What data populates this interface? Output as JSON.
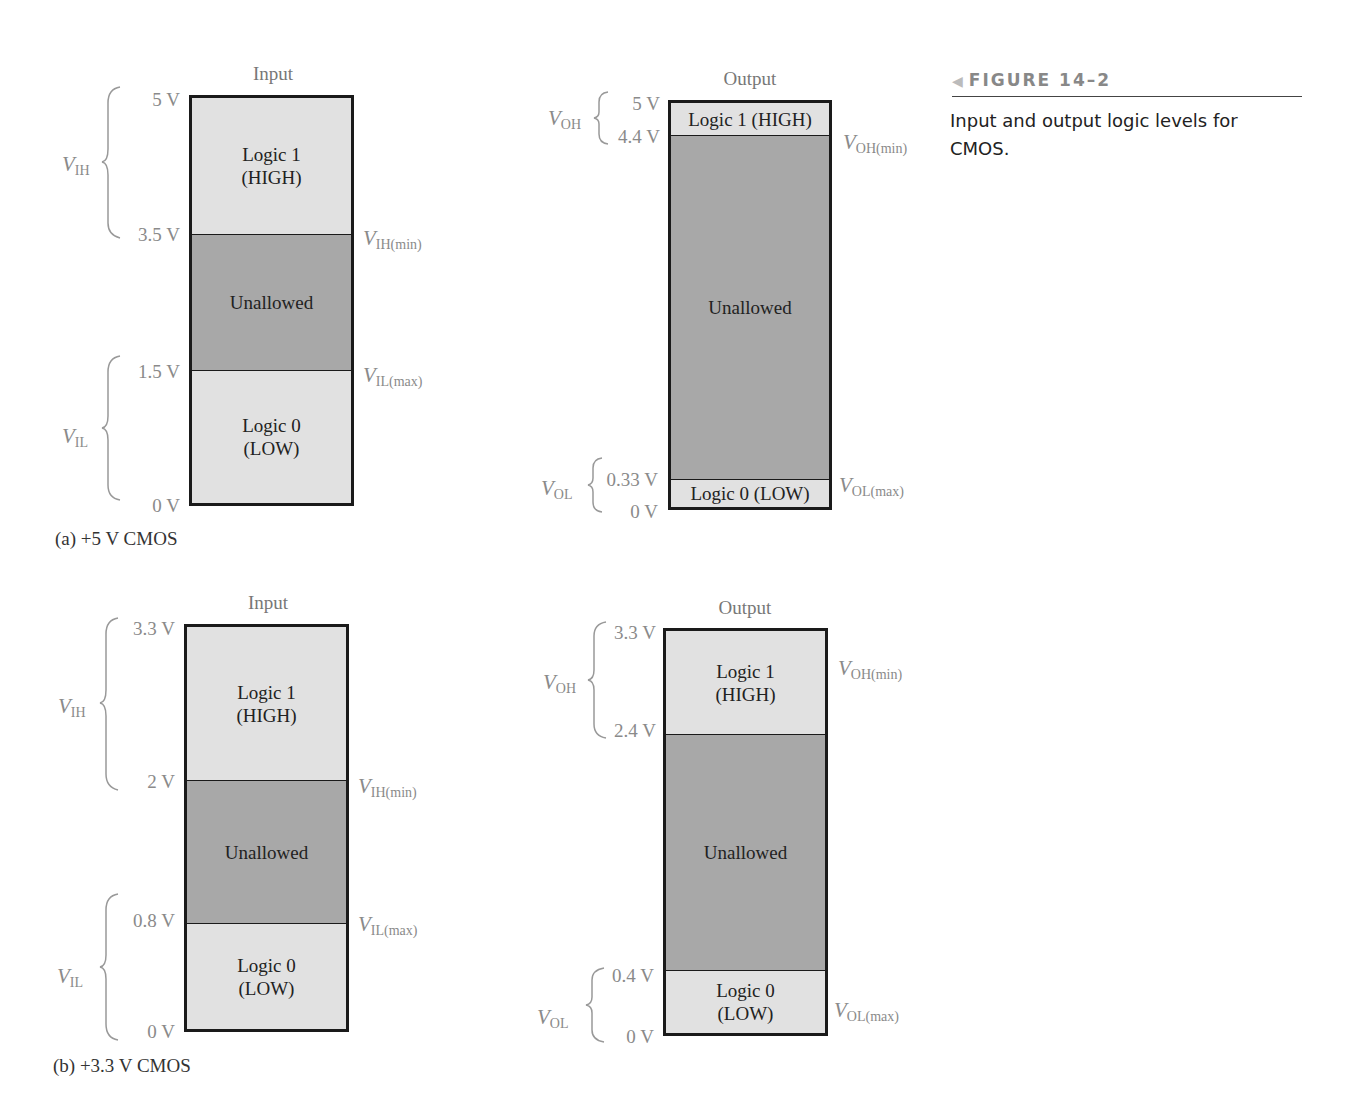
{
  "figure": {
    "number_label": "FIGURE 14–2",
    "arrow_icon": "left-triangle",
    "caption": "Input and output logic levels for CMOS."
  },
  "panels": {
    "a": {
      "caption": "(a)  +5 V CMOS",
      "input": {
        "title": "Input",
        "ticks": [
          "5 V",
          "3.5 V",
          "1.5 V",
          "0 V"
        ],
        "segments": {
          "high": {
            "line1": "Logic 1",
            "line2": "(HIGH)"
          },
          "unallowed": "Unallowed",
          "low": {
            "line1": "Logic 0",
            "line2": "(LOW)"
          }
        },
        "labels": {
          "vih": {
            "v": "V",
            "sub": "IH"
          },
          "vil": {
            "v": "V",
            "sub": "IL"
          },
          "vih_min": {
            "v": "V",
            "sub": "IH(min)"
          },
          "vil_max": {
            "v": "V",
            "sub": "IL(max)"
          }
        }
      },
      "output": {
        "title": "Output",
        "ticks": [
          "5 V",
          "4.4 V",
          "0.33 V",
          "0 V"
        ],
        "segments": {
          "high": "Logic 1 (HIGH)",
          "unallowed": "Unallowed",
          "low": "Logic 0 (LOW)"
        },
        "labels": {
          "voh": {
            "v": "V",
            "sub": "OH"
          },
          "vol": {
            "v": "V",
            "sub": "OL"
          },
          "voh_min": {
            "v": "V",
            "sub": "OH(min)"
          },
          "vol_max": {
            "v": "V",
            "sub": "OL(max)"
          }
        }
      }
    },
    "b": {
      "caption": "(b)  +3.3 V CMOS",
      "input": {
        "title": "Input",
        "ticks": [
          "3.3 V",
          "2 V",
          "0.8 V",
          "0 V"
        ],
        "segments": {
          "high": {
            "line1": "Logic 1",
            "line2": "(HIGH)"
          },
          "unallowed": "Unallowed",
          "low": {
            "line1": "Logic 0",
            "line2": "(LOW)"
          }
        },
        "labels": {
          "vih": {
            "v": "V",
            "sub": "IH"
          },
          "vil": {
            "v": "V",
            "sub": "IL"
          },
          "vih_min": {
            "v": "V",
            "sub": "IH(min)"
          },
          "vil_max": {
            "v": "V",
            "sub": "IL(max)"
          }
        }
      },
      "output": {
        "title": "Output",
        "ticks": [
          "3.3 V",
          "2.4 V",
          "0.4 V",
          "0 V"
        ],
        "segments": {
          "high": {
            "line1": "Logic 1",
            "line2": "(HIGH)"
          },
          "unallowed": "Unallowed",
          "low": {
            "line1": "Logic 0",
            "line2": "(LOW)"
          }
        },
        "labels": {
          "voh": {
            "v": "V",
            "sub": "OH"
          },
          "vol": {
            "v": "V",
            "sub": "OL"
          },
          "voh_min": {
            "v": "V",
            "sub": "OH(min)"
          },
          "vol_max": {
            "v": "V",
            "sub": "OL(max)"
          }
        }
      }
    }
  },
  "colors": {
    "logic_zone": "#e1e1e1",
    "unallowed_zone": "#a8a8a8",
    "annotation_gray": "#8a8a8a",
    "border": "#1a1a1a"
  }
}
